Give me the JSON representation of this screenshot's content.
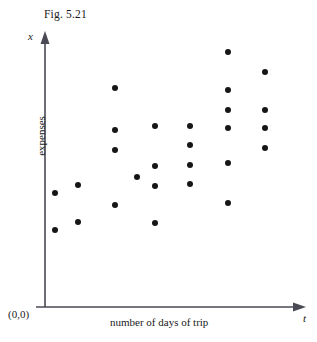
{
  "figure": {
    "title": "Fig. 5.21",
    "origin_label": "(0,0)",
    "y_axis_variable": "x",
    "x_axis_variable": "t",
    "y_axis_title": "expenses",
    "x_axis_title": "number of days of trip",
    "point_color": "#161616",
    "axis_color": "#4a4a55"
  },
  "chart_data": {
    "type": "scatter",
    "title": "Fig. 5.21",
    "xlabel": "number of days of trip",
    "ylabel": "expenses",
    "x_variable": "t",
    "y_variable": "x",
    "grid": false,
    "legend": "none",
    "axis_style": "arrow axes from origin (0,0), no tick labels",
    "xlim": [
      0,
      10
    ],
    "ylim": [
      0,
      10
    ],
    "note": "Positive association: expenses increase with number of days of trip",
    "series": [
      {
        "name": "trips",
        "n_points": 27,
        "x": [
          1,
          1,
          2,
          2,
          3,
          3,
          3,
          3,
          4,
          5,
          5,
          5,
          5,
          6,
          6,
          6,
          6,
          7,
          7,
          7,
          7,
          7,
          7,
          8,
          8,
          8,
          8
        ],
        "y": [
          4.4,
          3.0,
          4.7,
          3.2,
          8.2,
          6.6,
          5.9,
          4.0,
          5.0,
          6.8,
          5.5,
          4.8,
          3.5,
          6.8,
          6.1,
          5.4,
          4.7,
          9.4,
          8.0,
          7.3,
          6.7,
          5.5,
          4.1,
          8.7,
          7.3,
          6.7,
          6.0
        ],
        "columns": [
          {
            "t": 1,
            "count": 2,
            "expenses": [
              4.4,
              3.0
            ]
          },
          {
            "t": 2,
            "count": 2,
            "expenses": [
              4.7,
              3.2
            ]
          },
          {
            "t": 3,
            "count": 4,
            "expenses": [
              8.2,
              6.6,
              5.9,
              4.0
            ]
          },
          {
            "t": 4,
            "count": 1,
            "expenses": [
              5.0
            ]
          },
          {
            "t": 5,
            "count": 4,
            "expenses": [
              6.8,
              5.5,
              4.8,
              3.5
            ]
          },
          {
            "t": 6,
            "count": 4,
            "expenses": [
              6.8,
              6.1,
              5.4,
              4.7
            ]
          },
          {
            "t": 7,
            "count": 6,
            "expenses": [
              9.4,
              8.0,
              7.3,
              6.7,
              5.5,
              4.1
            ]
          },
          {
            "t": 8,
            "count": 4,
            "expenses": [
              8.7,
              7.3,
              6.7,
              6.0
            ]
          }
        ]
      }
    ],
    "pixel_points": [
      {
        "px": 55,
        "py": 193
      },
      {
        "px": 55,
        "py": 230
      },
      {
        "px": 78,
        "py": 185
      },
      {
        "px": 78,
        "py": 222
      },
      {
        "px": 115,
        "py": 88
      },
      {
        "px": 115,
        "py": 130
      },
      {
        "px": 115,
        "py": 150
      },
      {
        "px": 115,
        "py": 205
      },
      {
        "px": 137,
        "py": 177
      },
      {
        "px": 155,
        "py": 126
      },
      {
        "px": 155,
        "py": 166
      },
      {
        "px": 155,
        "py": 186
      },
      {
        "px": 155,
        "py": 223
      },
      {
        "px": 190,
        "py": 126
      },
      {
        "px": 190,
        "py": 145
      },
      {
        "px": 190,
        "py": 165
      },
      {
        "px": 190,
        "py": 184
      },
      {
        "px": 228,
        "py": 52
      },
      {
        "px": 228,
        "py": 90
      },
      {
        "px": 228,
        "py": 110
      },
      {
        "px": 228,
        "py": 128
      },
      {
        "px": 228,
        "py": 163
      },
      {
        "px": 228,
        "py": 203
      },
      {
        "px": 265,
        "py": 72
      },
      {
        "px": 265,
        "py": 110
      },
      {
        "px": 265,
        "py": 128
      },
      {
        "px": 265,
        "py": 148
      }
    ]
  }
}
